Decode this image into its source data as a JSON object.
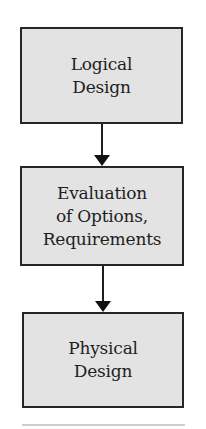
{
  "diagram": {
    "type": "flowchart",
    "direction": "top-to-bottom",
    "colors": {
      "box_fill": "#e3e3e3",
      "box_border": "#262626",
      "text": "#1e1e1e",
      "arrow": "#111111",
      "separator": "#cdcdcd"
    },
    "nodes": [
      {
        "id": "logical-design",
        "lines": [
          "Logical",
          "Design"
        ]
      },
      {
        "id": "evaluation",
        "lines": [
          "Evaluation",
          "of Options,",
          "Requirements"
        ]
      },
      {
        "id": "physical-design",
        "lines": [
          "Physical",
          "Design"
        ]
      }
    ],
    "edges": [
      {
        "from": "logical-design",
        "to": "evaluation"
      },
      {
        "from": "evaluation",
        "to": "physical-design"
      }
    ]
  }
}
